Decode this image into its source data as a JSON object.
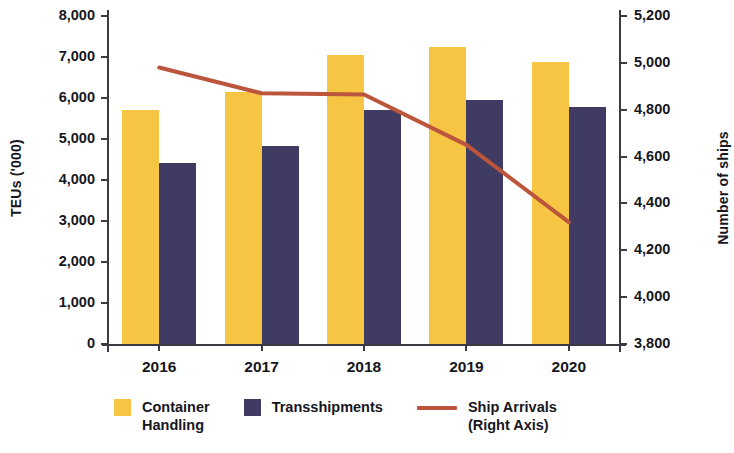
{
  "chart_data": {
    "type": "bar",
    "title": "",
    "categories": [
      "2016",
      "2017",
      "2018",
      "2019",
      "2020"
    ],
    "series": [
      {
        "name": "Container Handling",
        "type": "bar",
        "axis": "left",
        "color": "#F7C544",
        "values": [
          5700,
          6150,
          7050,
          7250,
          6870
        ]
      },
      {
        "name": "Transshipments",
        "type": "bar",
        "axis": "left",
        "color": "#3F3B63",
        "values": [
          4420,
          4830,
          5700,
          5950,
          5780
        ]
      },
      {
        "name": "Ship Arrivals (Right Axis)",
        "type": "line",
        "axis": "right",
        "color": "#BB553B",
        "values": [
          4980,
          4870,
          4865,
          4650,
          4320
        ]
      }
    ],
    "xlabel": "",
    "ylabel": "TEUs  ('000)",
    "y2label": "Number of ships",
    "ylim": [
      0,
      8000
    ],
    "y2lim": [
      3800,
      5200
    ],
    "yticks": [
      "0",
      "1,000",
      "2,000",
      "3,000",
      "4,000",
      "5,000",
      "6,000",
      "7,000",
      "8,000"
    ],
    "ytick_values": [
      0,
      1000,
      2000,
      3000,
      4000,
      5000,
      6000,
      7000,
      8000
    ],
    "y2ticks": [
      "3,800",
      "4,000",
      "4,200",
      "4,400",
      "4,600",
      "4,800",
      "5,000",
      "5,200"
    ],
    "y2tick_values": [
      3800,
      4000,
      4200,
      4400,
      4600,
      4800,
      5000,
      5200
    ],
    "grid": false,
    "legend_position": "bottom"
  },
  "legend": {
    "items": [
      {
        "label": "Container\nHandling",
        "marker": "square",
        "color": "#F7C544"
      },
      {
        "label": "Transshipments",
        "marker": "square",
        "color": "#3F3B63"
      },
      {
        "label": "Ship Arrivals\n(Right Axis)",
        "marker": "line",
        "color": "#BB553B"
      }
    ]
  }
}
